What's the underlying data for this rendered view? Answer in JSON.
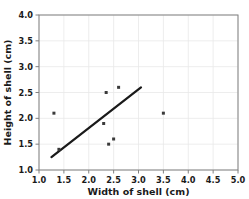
{
  "chart_data": {
    "type": "scatter",
    "title": "",
    "xlabel": "Width of shell (cm)",
    "ylabel": "Height of shell (cm)",
    "xlim": [
      1.0,
      5.0
    ],
    "ylim": [
      1.0,
      4.0
    ],
    "xticks": [
      "1.0",
      "1.5",
      "2.0",
      "2.5",
      "3.0",
      "3.5",
      "4.0",
      "4.5",
      "5.0"
    ],
    "yticks": [
      "1.0",
      "1.5",
      "2.0",
      "2.5",
      "3.0",
      "3.5",
      "4.0"
    ],
    "xtick_values": [
      1.0,
      1.5,
      2.0,
      2.5,
      3.0,
      3.5,
      4.0,
      4.5,
      5.0
    ],
    "ytick_values": [
      1.0,
      1.5,
      2.0,
      2.5,
      3.0,
      3.5,
      4.0
    ],
    "grid": true,
    "legend": "none",
    "marker_color": "#3a3a3a",
    "line_color": "#1a1a1a",
    "grid_color": "#e8e8e8",
    "axis_color": "#808080",
    "points": [
      {
        "x": 1.3,
        "y": 2.1
      },
      {
        "x": 1.4,
        "y": 1.4
      },
      {
        "x": 2.3,
        "y": 1.9
      },
      {
        "x": 2.35,
        "y": 2.5
      },
      {
        "x": 2.4,
        "y": 1.5
      },
      {
        "x": 2.5,
        "y": 1.6
      },
      {
        "x": 2.6,
        "y": 2.6
      },
      {
        "x": 3.5,
        "y": 2.1
      }
    ],
    "trend_line": {
      "name": "line of best fit",
      "x1": 1.25,
      "y1": 1.25,
      "x2": 3.05,
      "y2": 2.6
    }
  }
}
